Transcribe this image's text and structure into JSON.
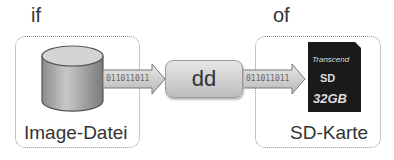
{
  "labels": {
    "input": "if",
    "output": "of"
  },
  "source": {
    "caption": "Image-Datei",
    "icon": "database-cylinder-icon"
  },
  "tool": {
    "label": "dd"
  },
  "flow": {
    "bits_in": "011011011",
    "bits_out": "011011011"
  },
  "target": {
    "caption": "SD-Karte",
    "icon": "sd-card-icon",
    "brand": "Transcend",
    "capacity": "32GB"
  }
}
